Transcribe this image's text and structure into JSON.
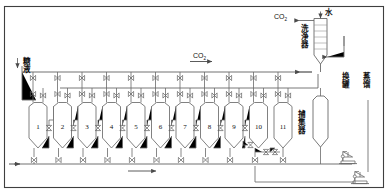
{
  "diagram": {
    "title_type": "carbonation-battery-process-flow",
    "colors": {
      "line": "#6f6f6f",
      "line_dark": "#3a3a3a",
      "text": "#111111",
      "bg": "#ffffff"
    },
    "labels": {
      "co2_top": "CO",
      "co2_top_sub": "2",
      "water": "水",
      "scrubber": "洗浄器",
      "co2_main": "CO",
      "co2_main_sub": "2",
      "syrup": "糖液",
      "collector": "捕集器",
      "tank_change": "换罐",
      "distillation": "蒸馏"
    },
    "vessels": [
      {
        "id": "1",
        "label": "1"
      },
      {
        "id": "2",
        "label": "2"
      },
      {
        "id": "3",
        "label": "3"
      },
      {
        "id": "4",
        "label": "4"
      },
      {
        "id": "5",
        "label": "5"
      },
      {
        "id": "6",
        "label": "6"
      },
      {
        "id": "7",
        "label": "7"
      },
      {
        "id": "8",
        "label": "8"
      },
      {
        "id": "9",
        "label": "9"
      },
      {
        "id": "10",
        "label": "10"
      },
      {
        "id": "11",
        "label": "11"
      }
    ],
    "equipment": [
      {
        "name": "scrubber-column",
        "label": "洗浄器"
      },
      {
        "name": "collector-vessel",
        "label": "捕集器"
      },
      {
        "name": "pump-1",
        "label": ""
      },
      {
        "name": "pump-2",
        "label": ""
      }
    ],
    "streams": [
      {
        "name": "co2-outlet",
        "label": "CO2",
        "direction": "left"
      },
      {
        "name": "water-inlet",
        "label": "水",
        "direction": "down"
      },
      {
        "name": "co2-header",
        "label": "CO2",
        "direction": "right"
      },
      {
        "name": "syrup-inlet",
        "label": "糖液",
        "direction": "down"
      },
      {
        "name": "bottom-header",
        "label": "",
        "direction": "right"
      }
    ]
  }
}
